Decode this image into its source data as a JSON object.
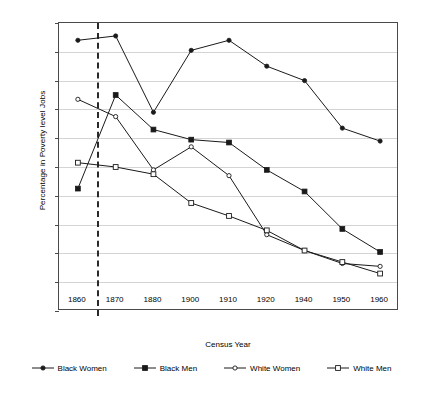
{
  "chart_data": {
    "type": "line",
    "title": "",
    "xlabel": "Census Year",
    "ylabel": "Percentage in Poverty level Jobs",
    "categories": [
      "1860",
      "1870",
      "1880",
      "1900",
      "1910",
      "1920",
      "1940",
      "1950",
      "1960"
    ],
    "ylim": [
      0,
      100
    ],
    "ytick_labels": [
      "0",
      "10",
      "20",
      "30",
      "40",
      "50",
      "60",
      "70",
      "80",
      "90",
      "100"
    ],
    "ytick_values": [
      0,
      10,
      20,
      30,
      40,
      50,
      60,
      70,
      80,
      90,
      100
    ],
    "grid": "horizontal",
    "legend_position": "bottom",
    "annotations": [
      {
        "name": "emancipation-divider",
        "type": "vertical-dashed-line",
        "between": [
          "1860",
          "1870"
        ],
        "fraction": 0.5,
        "label": ""
      }
    ],
    "series": [
      {
        "name": "Black Women",
        "marker": "filled-circle",
        "values": [
          94,
          95.5,
          69,
          90.5,
          94,
          85,
          80,
          63.5,
          59
        ]
      },
      {
        "name": "Black Men",
        "marker": "filled-square",
        "values": [
          42.5,
          75,
          63,
          59.5,
          58.5,
          49,
          41.5,
          28.5,
          20.5
        ]
      },
      {
        "name": "White Women",
        "marker": "open-circle",
        "values": [
          73.5,
          67.5,
          49,
          57,
          47,
          26.5,
          21,
          16.5,
          15.5
        ]
      },
      {
        "name": "White Men",
        "marker": "open-square",
        "values": [
          51.5,
          50,
          47.5,
          37.5,
          33,
          28,
          21,
          17,
          13
        ]
      }
    ]
  },
  "colors": {
    "line": "#1a1a1a",
    "grid": "#d4d4d4",
    "axis": "#4a4a4a",
    "background": "#ffffff",
    "marker_fill": "#1a1a1a",
    "marker_open": "#ffffff"
  }
}
